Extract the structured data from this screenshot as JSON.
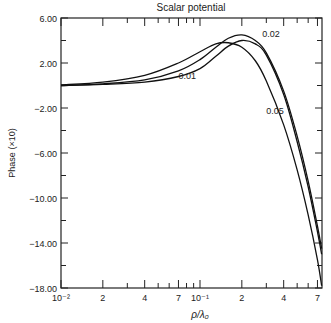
{
  "chart_data": {
    "type": "line",
    "title": "Scalar potential",
    "xlabel": "ρ/λ₀",
    "ylabel": "Phase (×10)",
    "xscale": "log",
    "xlim": [
      0.01,
      0.75
    ],
    "ylim": [
      -18,
      6
    ],
    "grid": false,
    "y_ticks": [
      "6.00",
      "2.00",
      "-2.00",
      "-6.00",
      "-10.00",
      "-14.00",
      "-18.00"
    ],
    "y_tick_values": [
      6,
      2,
      -2,
      -6,
      -10,
      -14,
      -18
    ],
    "x_tick_labels": [
      {
        "value": 0.01,
        "label": "10⁻²"
      },
      {
        "value": 0.02,
        "label": "2"
      },
      {
        "value": 0.04,
        "label": "4"
      },
      {
        "value": 0.07,
        "label": "7"
      },
      {
        "value": 0.1,
        "label": "10⁻¹"
      },
      {
        "value": 0.2,
        "label": "2"
      },
      {
        "value": 0.4,
        "label": "4"
      },
      {
        "value": 0.7,
        "label": "7"
      }
    ],
    "legend": "curve labels inline",
    "series": [
      {
        "name": "0.01",
        "x": [
          0.01,
          0.02,
          0.04,
          0.07,
          0.1,
          0.13,
          0.16,
          0.2,
          0.25,
          0.3,
          0.4,
          0.5,
          0.6,
          0.7,
          0.75
        ],
        "y": [
          0.05,
          0.3,
          0.9,
          2.0,
          3.0,
          3.7,
          3.8,
          3.4,
          2.2,
          0.4,
          -3.5,
          -7.5,
          -11.5,
          -15.5,
          -17.8
        ]
      },
      {
        "name": "0.02",
        "x": [
          0.01,
          0.02,
          0.04,
          0.07,
          0.1,
          0.13,
          0.16,
          0.2,
          0.25,
          0.3,
          0.4,
          0.5,
          0.6,
          0.7,
          0.75
        ],
        "y": [
          0.0,
          0.15,
          0.5,
          1.3,
          2.3,
          3.4,
          4.2,
          4.5,
          4.0,
          2.9,
          -0.5,
          -4.5,
          -8.5,
          -12.5,
          -14.5
        ]
      },
      {
        "name": "0.05",
        "x": [
          0.01,
          0.02,
          0.04,
          0.07,
          0.1,
          0.13,
          0.16,
          0.2,
          0.25,
          0.3,
          0.4,
          0.5,
          0.6,
          0.7,
          0.75
        ],
        "y": [
          0.0,
          0.1,
          0.3,
          0.8,
          1.5,
          2.6,
          3.5,
          4.0,
          3.7,
          2.7,
          -0.8,
          -5.0,
          -9.0,
          -13.0,
          -15.0
        ]
      }
    ],
    "annotations": [
      {
        "text": "0.02",
        "x": 0.28,
        "y": 4.3
      },
      {
        "text": "0.01",
        "x": 0.07,
        "y": 0.6
      },
      {
        "text": "0.05",
        "x": 0.3,
        "y": -2.5
      }
    ]
  }
}
